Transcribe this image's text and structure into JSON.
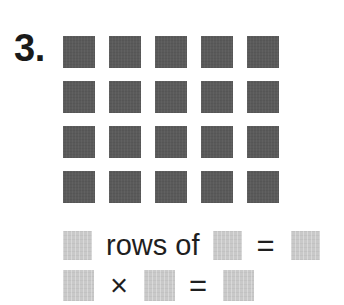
{
  "problem": {
    "number_label": "3.",
    "array": {
      "rows": 4,
      "columns": 5,
      "total": 20,
      "cell_color": "#5a5a5a"
    },
    "blank_color": "#c9c9c9",
    "answer_lines": [
      {
        "id": "rows-of-line",
        "tokens": [
          {
            "type": "blank"
          },
          {
            "type": "text",
            "value": "rows of"
          },
          {
            "type": "blank"
          },
          {
            "type": "operator",
            "value": "="
          },
          {
            "type": "blank"
          }
        ]
      },
      {
        "id": "multiplication-line",
        "tokens": [
          {
            "type": "blank"
          },
          {
            "type": "operator",
            "value": "×"
          },
          {
            "type": "blank"
          },
          {
            "type": "operator",
            "value": "="
          },
          {
            "type": "blank"
          }
        ]
      }
    ],
    "text": {
      "rows_of": "rows of",
      "times": "×",
      "equals": "="
    }
  }
}
